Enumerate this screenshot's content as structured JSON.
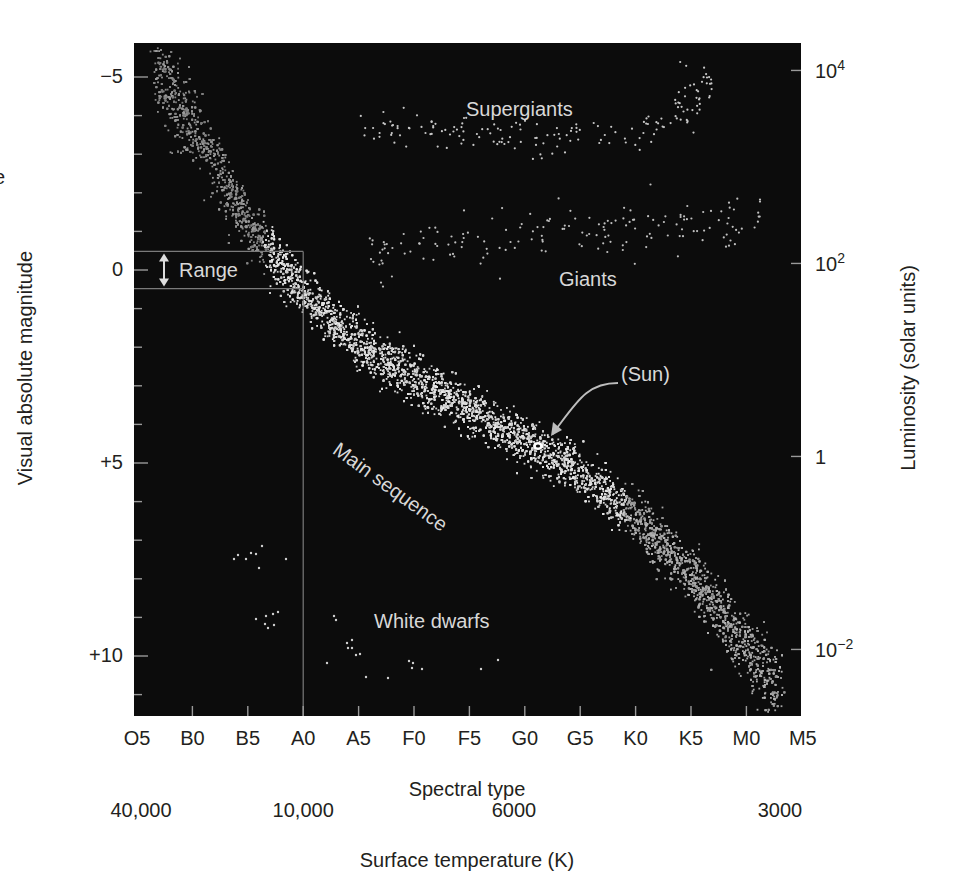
{
  "chart_data": {
    "type": "scatter",
    "title": "",
    "xlabel": "Spectral type",
    "xlabel_secondary": "Surface temperature (K)",
    "ylabel": "Visual absolute magnitude",
    "ylabel_right": "Luminosity (solar units)",
    "grid": false,
    "background_color": "#0c0c0c",
    "point_color": "#d9d9d9",
    "x_categories": [
      "O5",
      "B0",
      "B5",
      "A0",
      "A5",
      "F0",
      "F5",
      "G0",
      "G5",
      "K0",
      "K5",
      "M0",
      "M5"
    ],
    "x_temperature_ticks": [
      {
        "label": "40,000",
        "at": "O5"
      },
      {
        "label": "10,000",
        "at": "A0"
      },
      {
        "label": "6000",
        "at": "G0"
      },
      {
        "label": "3000",
        "at": "M5"
      }
    ],
    "y_ticks_left": [
      {
        "label": "−5",
        "value": -5
      },
      {
        "label": "0",
        "value": 0
      },
      {
        "label": "+5",
        "value": 5
      },
      {
        "label": "+10",
        "value": 10
      }
    ],
    "y_minor_step": 1,
    "ylim_left": [
      -5.7,
      11.3
    ],
    "y_inverted": true,
    "y_ticks_right": [
      {
        "base": "10",
        "exp": "4",
        "value": 10000
      },
      {
        "base": "10",
        "exp": "2",
        "value": 100
      },
      {
        "base": "1",
        "exp": "",
        "value": 1
      },
      {
        "base": "10",
        "exp": "−2",
        "value": 0.01
      }
    ],
    "regions": [
      {
        "name": "Supergiants",
        "label": "Supergiants",
        "spectral_range": [
          "A5",
          "K5"
        ],
        "magnitude_range": [
          -5.3,
          -3.0
        ]
      },
      {
        "name": "Giants",
        "label": "Giants",
        "spectral_range": [
          "A5",
          "M0"
        ],
        "magnitude_range": [
          -1.3,
          0.7
        ]
      },
      {
        "name": "Main sequence",
        "label": "Main sequence",
        "spectral_range": [
          "O5",
          "M5"
        ],
        "magnitude_range": [
          -5.5,
          11.0
        ]
      },
      {
        "name": "White dwarfs",
        "label": "White dwarfs",
        "spectral_range": [
          "B5",
          "F5"
        ],
        "magnitude_range": [
          7.0,
          11.0
        ]
      }
    ],
    "annotations": [
      {
        "label": "(Sun)",
        "spectral_type": "G2",
        "magnitude": 4.8,
        "luminosity": 1
      },
      {
        "label": "Range",
        "type": "magnitude-range-bracket",
        "magnitude_range": [
          -0.5,
          0.5
        ],
        "spectral_type": "A0"
      }
    ],
    "main_sequence_path": [
      {
        "sp": 0.3,
        "mag": -5.3
      },
      {
        "sp": 1.0,
        "mag": -3.8
      },
      {
        "sp": 2.0,
        "mag": -1.2
      },
      {
        "sp": 3.0,
        "mag": 0.6
      },
      {
        "sp": 4.0,
        "mag": 1.9
      },
      {
        "sp": 5.0,
        "mag": 2.8
      },
      {
        "sp": 6.0,
        "mag": 3.6
      },
      {
        "sp": 7.0,
        "mag": 4.4
      },
      {
        "sp": 8.0,
        "mag": 5.3
      },
      {
        "sp": 9.0,
        "mag": 6.4
      },
      {
        "sp": 10.0,
        "mag": 7.9
      },
      {
        "sp": 11.0,
        "mag": 9.8
      },
      {
        "sp": 11.6,
        "mag": 10.9
      }
    ]
  },
  "labels": {
    "range": "Range",
    "sun": "(Sun)",
    "supergiants": "Supergiants",
    "giants": "Giants",
    "main_sequence": "Main sequence",
    "white_dwarfs": "White dwarfs",
    "left_fragment": "e"
  }
}
